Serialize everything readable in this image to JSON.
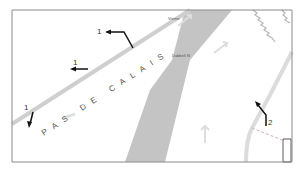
{
  "map": {
    "street_name": "PAS DE CALAIS",
    "place_labels": {
      "top": "Vierne",
      "middle": "Dubbelt N",
      "top_left_faint": "",
      "bottom_right_faint": ""
    },
    "markers": [
      {
        "id": "arrow-1a",
        "label": "1",
        "direction": "west"
      },
      {
        "id": "arrow-1b",
        "label": "1",
        "direction": "south-southwest"
      },
      {
        "id": "arrow-2a",
        "label": "2",
        "direction": "west"
      },
      {
        "id": "arrow-2b",
        "label": "2",
        "direction": "northwest"
      }
    ],
    "colors": {
      "frame": "#8a8a8a",
      "band": "#c4c4c4",
      "road": "#cfcfcf",
      "arrow": "#111111",
      "zigzag": "#b5b5b5",
      "dashed": "#d8a0a0"
    }
  }
}
